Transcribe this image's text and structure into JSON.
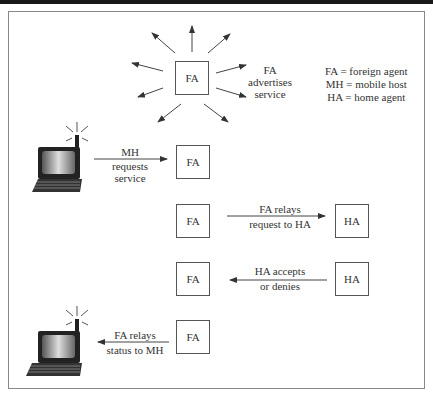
{
  "diagram": {
    "legend": [
      "FA = foreign agent",
      "MH = mobile host",
      "HA = home agent"
    ],
    "step1": {
      "box": "FA",
      "label_lines": [
        "FA",
        "advertises",
        "service"
      ]
    },
    "step2": {
      "box": "FA",
      "label_lines": [
        "MH",
        "requests",
        "service"
      ],
      "from": "laptop"
    },
    "step3": {
      "from_box": "FA",
      "to_box": "HA",
      "label_lines": [
        "FA relays",
        "request to HA"
      ]
    },
    "step4": {
      "from_box": "HA",
      "to_box": "FA",
      "label_lines": [
        "HA accepts",
        "or denies"
      ]
    },
    "step5": {
      "box": "FA",
      "label_lines": [
        "FA relays",
        "status to MH"
      ],
      "to": "laptop"
    },
    "colors": {
      "line": "#444444",
      "box_border": "#555555",
      "top_bar": "#1a1a1a",
      "frame": "#888888"
    }
  }
}
